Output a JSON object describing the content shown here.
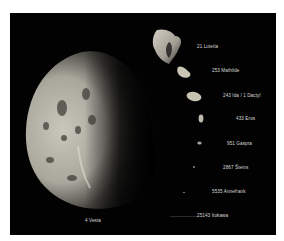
{
  "image": {
    "description": "Size comparison of asteroids imaged by spacecraft",
    "background": "#020202",
    "frame_color": "#ffffff"
  },
  "bodies": [
    {
      "name": "21 Lutetia"
    },
    {
      "name": "253 Mathilde"
    },
    {
      "name": "243 Ida / 1 Dactyl"
    },
    {
      "name": "433 Eros"
    },
    {
      "name": "951 Gaspra"
    },
    {
      "name": "2867 Šteins"
    },
    {
      "name": "5535 Annefrank"
    },
    {
      "name": "25143 Itokawa"
    },
    {
      "name": "4 Vesta"
    }
  ]
}
